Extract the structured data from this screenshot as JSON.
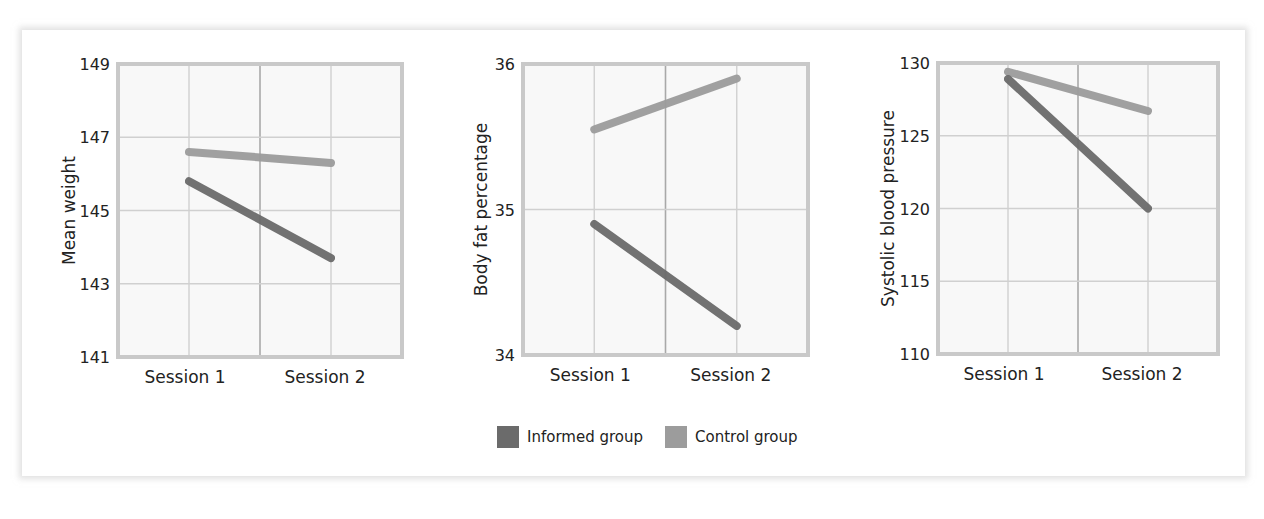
{
  "chart_data": [
    {
      "type": "line",
      "title": "",
      "xlabel": "",
      "ylabel": "Mean weight",
      "categories": [
        "Session 1",
        "Session 2"
      ],
      "yticks": [
        141,
        143,
        145,
        147,
        149
      ],
      "ylim": [
        141,
        149
      ],
      "grid": true,
      "series": [
        {
          "name": "Informed group",
          "values": [
            145.8,
            143.7
          ]
        },
        {
          "name": "Control group",
          "values": [
            146.6,
            146.3
          ]
        }
      ]
    },
    {
      "type": "line",
      "title": "",
      "xlabel": "",
      "ylabel": "Body fat percentage",
      "categories": [
        "Session 1",
        "Session 2"
      ],
      "yticks": [
        34,
        35,
        36
      ],
      "ylim": [
        34,
        36
      ],
      "grid": true,
      "series": [
        {
          "name": "Informed group",
          "values": [
            34.9,
            34.2
          ]
        },
        {
          "name": "Control group",
          "values": [
            35.55,
            35.9
          ]
        }
      ]
    },
    {
      "type": "line",
      "title": "",
      "xlabel": "",
      "ylabel": "Systolic blood pressure",
      "categories": [
        "Session 1",
        "Session 2"
      ],
      "yticks": [
        110,
        115,
        120,
        125,
        130
      ],
      "ylim": [
        110,
        130
      ],
      "grid": true,
      "series": [
        {
          "name": "Informed group",
          "values": [
            128.9,
            120.0
          ]
        },
        {
          "name": "Control group",
          "values": [
            129.4,
            126.7
          ]
        }
      ]
    }
  ],
  "legend": {
    "position": "bottom-center",
    "items": [
      {
        "label": "Informed group",
        "color": "#6b6b6b"
      },
      {
        "label": "Control group",
        "color": "#9c9c9c"
      }
    ]
  },
  "colors": {
    "informed": "#6b6b6b",
    "control": "#9c9c9c",
    "grid": "#d0d0d0",
    "frame": "#c9c9c9",
    "plot_bg": "#f8f8f8"
  }
}
